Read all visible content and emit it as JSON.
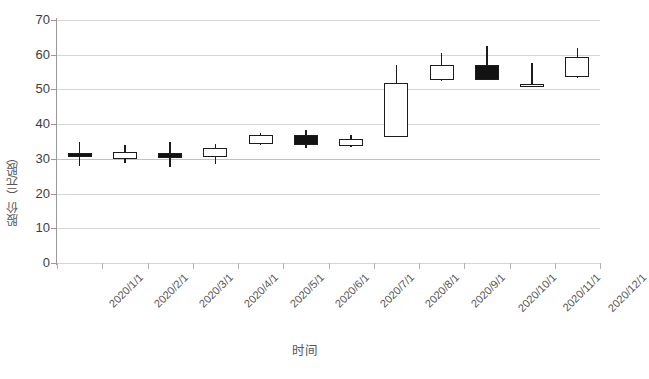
{
  "chart_data": {
    "type": "candlestick",
    "title": "",
    "xlabel": "时间",
    "ylabel": "股价（元/股）",
    "ylim": [
      0,
      70
    ],
    "ytick_step": 10,
    "yticks": [
      0,
      10,
      20,
      30,
      40,
      50,
      60,
      70
    ],
    "ytick_labels": [
      "0",
      "10",
      "20",
      "30",
      "40",
      "50",
      "60",
      "70"
    ],
    "grid": true,
    "legend": false,
    "categories": [
      "2020/1/1",
      "2020/2/1",
      "2020/3/1",
      "2020/4/1",
      "2020/5/1",
      "2020/6/1",
      "2020/7/1",
      "2020/8/1",
      "2020/9/1",
      "2020/10/1",
      "2020/11/1",
      "2020/12/1"
    ],
    "series": [
      {
        "name": "股价",
        "fields": [
          "open",
          "high",
          "low",
          "close"
        ],
        "values": [
          {
            "date": "2020/1/1",
            "open": 31.8,
            "high": 35.0,
            "low": 28.0,
            "close": 30.4,
            "direction": "down"
          },
          {
            "date": "2020/2/1",
            "open": 30.0,
            "high": 34.0,
            "low": 28.8,
            "close": 32.0,
            "direction": "up"
          },
          {
            "date": "2020/3/1",
            "open": 31.6,
            "high": 35.0,
            "low": 27.6,
            "close": 30.2,
            "direction": "down"
          },
          {
            "date": "2020/4/1",
            "open": 30.4,
            "high": 34.2,
            "low": 28.4,
            "close": 33.0,
            "direction": "up"
          },
          {
            "date": "2020/5/1",
            "open": 34.2,
            "high": 37.4,
            "low": 34.0,
            "close": 37.0,
            "direction": "up"
          },
          {
            "date": "2020/6/1",
            "open": 36.8,
            "high": 38.2,
            "low": 33.0,
            "close": 34.0,
            "direction": "down"
          },
          {
            "date": "2020/7/1",
            "open": 33.6,
            "high": 36.8,
            "low": 33.4,
            "close": 35.8,
            "direction": "up"
          },
          {
            "date": "2020/8/1",
            "open": 36.4,
            "high": 57.0,
            "low": 36.2,
            "close": 51.8,
            "direction": "up"
          },
          {
            "date": "2020/9/1",
            "open": 52.6,
            "high": 60.6,
            "low": 52.4,
            "close": 57.0,
            "direction": "up"
          },
          {
            "date": "2020/10/1",
            "open": 57.0,
            "high": 62.4,
            "low": 52.8,
            "close": 52.8,
            "direction": "down"
          },
          {
            "date": "2020/11/1",
            "open": 51.0,
            "high": 57.6,
            "low": 50.6,
            "close": 51.6,
            "direction": "up"
          },
          {
            "date": "2020/12/1",
            "open": 53.6,
            "high": 61.8,
            "low": 53.4,
            "close": 59.4,
            "direction": "up"
          }
        ]
      }
    ],
    "colors": {
      "up_fill": "#ffffff",
      "down_fill": "#121212",
      "outline": "#1c1c1c",
      "gridline": "#d6d6d6",
      "axis": "#9a9a9a",
      "text": "#3d3d3d"
    }
  }
}
